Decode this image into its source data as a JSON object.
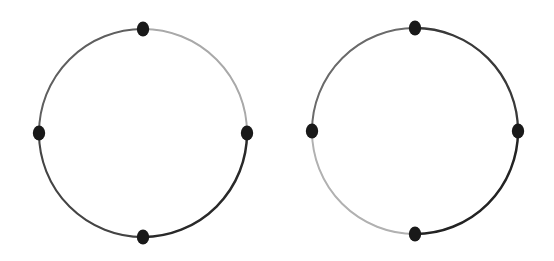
{
  "figure": {
    "background_color": "#ffffff",
    "width": 554,
    "height": 261,
    "node_count_each": 4
  },
  "chart_data": {
    "type": "diagram",
    "diagram_kind": "node-link cycle graph",
    "xlabel": "",
    "ylabel": "",
    "grid": false,
    "legend": "none",
    "background_color": "#ffffff",
    "node_style": {
      "shape": "ellipse",
      "rx": 6.2,
      "ry": 7.6,
      "fill": "#1b1b1b"
    },
    "graphs": [
      {
        "name": "left-cycle-graph",
        "center_x": 143,
        "center_y": 133,
        "radius": 104,
        "nodes": [
          {
            "id": "L-top",
            "position": "top",
            "angle_deg": 90,
            "x": 143,
            "y": 29,
            "color": "#1b1b1b"
          },
          {
            "id": "L-right",
            "position": "right",
            "angle_deg": 0,
            "x": 247,
            "y": 133,
            "color": "#1b1b1b"
          },
          {
            "id": "L-bottom",
            "position": "bottom",
            "angle_deg": 270,
            "x": 143,
            "y": 237,
            "color": "#1b1b1b"
          },
          {
            "id": "L-left",
            "position": "left",
            "angle_deg": 180,
            "x": 39,
            "y": 133,
            "color": "#1b1b1b"
          }
        ],
        "edges": [
          {
            "id": "L-edge-top-right",
            "from": "L-top",
            "to": "L-right",
            "quadrant": "top-right",
            "color": "#a8a8a8",
            "width": 2.0,
            "shade": "light"
          },
          {
            "id": "L-edge-right-bottom",
            "from": "L-right",
            "to": "L-bottom",
            "quadrant": "bottom-right",
            "color": "#2b2b2b",
            "width": 2.5,
            "shade": "dark"
          },
          {
            "id": "L-edge-bottom-left",
            "from": "L-bottom",
            "to": "L-left",
            "quadrant": "bottom-left",
            "color": "#454545",
            "width": 2.1,
            "shade": "dark"
          },
          {
            "id": "L-edge-left-top",
            "from": "L-left",
            "to": "L-top",
            "quadrant": "top-left",
            "color": "#606060",
            "width": 2.0,
            "shade": "medium"
          }
        ]
      },
      {
        "name": "right-cycle-graph",
        "center_x": 415,
        "center_y": 131,
        "radius": 103,
        "nodes": [
          {
            "id": "R-top",
            "position": "top",
            "angle_deg": 90,
            "x": 415,
            "y": 28,
            "color": "#1b1b1b"
          },
          {
            "id": "R-right",
            "position": "right",
            "angle_deg": 0,
            "x": 518,
            "y": 131,
            "color": "#1b1b1b"
          },
          {
            "id": "R-bottom",
            "position": "bottom",
            "angle_deg": 270,
            "x": 415,
            "y": 234,
            "color": "#1b1b1b"
          },
          {
            "id": "R-left",
            "position": "left",
            "angle_deg": 180,
            "x": 312,
            "y": 131,
            "color": "#1b1b1b"
          }
        ],
        "edges": [
          {
            "id": "R-edge-top-right",
            "from": "R-top",
            "to": "R-right",
            "quadrant": "top-right",
            "color": "#3a3a3a",
            "width": 2.3,
            "shade": "dark"
          },
          {
            "id": "R-edge-right-bottom",
            "from": "R-right",
            "to": "R-bottom",
            "quadrant": "bottom-right",
            "color": "#252525",
            "width": 2.5,
            "shade": "dark"
          },
          {
            "id": "R-edge-bottom-left",
            "from": "R-bottom",
            "to": "R-left",
            "quadrant": "bottom-left",
            "color": "#b0b0b0",
            "width": 2.0,
            "shade": "light"
          },
          {
            "id": "R-edge-left-top",
            "from": "R-left",
            "to": "R-top",
            "quadrant": "top-left",
            "color": "#6a6a6a",
            "width": 2.0,
            "shade": "medium"
          }
        ]
      }
    ]
  }
}
